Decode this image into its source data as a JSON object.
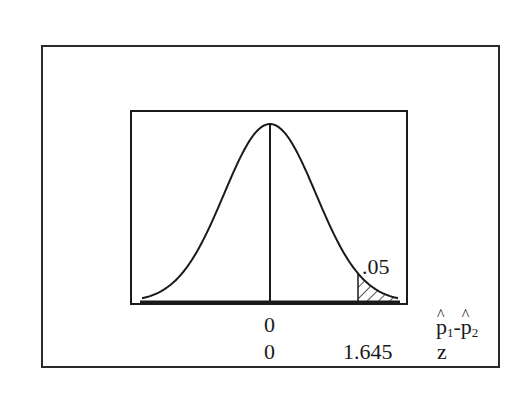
{
  "diagram": {
    "distribution": "normal",
    "shaded_tail": "right",
    "tail_area_label": ".05",
    "axes": [
      {
        "name": "p-hat difference",
        "label_parts": {
          "p1": "p",
          "sub1": "1",
          "minus": "-",
          "p2": "p",
          "sub2": "2",
          "hat": "^"
        },
        "ticks": [
          {
            "position": "center",
            "label": "0"
          }
        ]
      },
      {
        "name": "z",
        "label": "z",
        "ticks": [
          {
            "position": "center",
            "label": "0"
          },
          {
            "position": "critical",
            "label": "1.645"
          }
        ]
      }
    ],
    "colors": {
      "line": "#1a1a1a",
      "background": "#ffffff"
    }
  }
}
